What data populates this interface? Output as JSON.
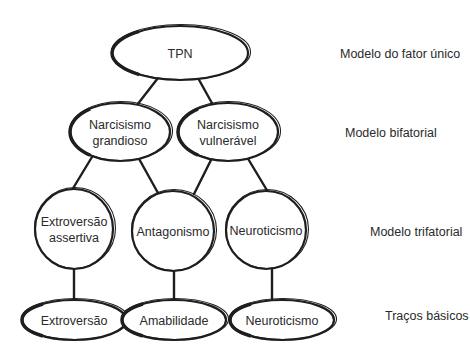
{
  "diagram": {
    "levels": [
      {
        "id": "l0",
        "label": "Modelo do fator único"
      },
      {
        "id": "l1",
        "label": "Modelo bifatorial"
      },
      {
        "id": "l2",
        "label": "Modelo trifatorial"
      },
      {
        "id": "l3",
        "label": "Traços básicos"
      }
    ],
    "nodes": [
      {
        "id": "tpn",
        "lines": [
          "TPN"
        ],
        "level": 0,
        "shape": "ellipse"
      },
      {
        "id": "ng",
        "lines": [
          "Narcisismo",
          "grandioso"
        ],
        "level": 1,
        "shape": "ellipse"
      },
      {
        "id": "nv",
        "lines": [
          "Narcisismo",
          "vulnerável"
        ],
        "level": 1,
        "shape": "ellipse"
      },
      {
        "id": "ea",
        "lines": [
          "Extroversão",
          "assertiva"
        ],
        "level": 2,
        "shape": "circle"
      },
      {
        "id": "ant",
        "lines": [
          "Antagonismo"
        ],
        "level": 2,
        "shape": "circle"
      },
      {
        "id": "neu",
        "lines": [
          "Neuroticismo"
        ],
        "level": 2,
        "shape": "circle"
      },
      {
        "id": "ext",
        "lines": [
          "Extroversão"
        ],
        "level": 3,
        "shape": "ellipse"
      },
      {
        "id": "ama",
        "lines": [
          "Amabilidade"
        ],
        "level": 3,
        "shape": "ellipse"
      },
      {
        "id": "neu2",
        "lines": [
          "Neuroticismo"
        ],
        "level": 3,
        "shape": "ellipse"
      }
    ],
    "edges": [
      [
        "tpn",
        "ng"
      ],
      [
        "tpn",
        "nv"
      ],
      [
        "ng",
        "ea"
      ],
      [
        "ng",
        "ant"
      ],
      [
        "nv",
        "ant"
      ],
      [
        "nv",
        "neu"
      ],
      [
        "ea",
        "ext"
      ],
      [
        "ant",
        "ama"
      ],
      [
        "neu",
        "neu2"
      ]
    ]
  }
}
